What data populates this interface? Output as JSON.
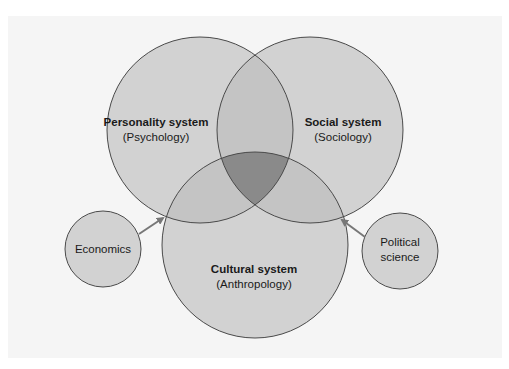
{
  "diagram": {
    "type": "venn",
    "colors": {
      "background": "#f5f5f5",
      "circle_fill": "#d2d2d2",
      "pair_overlap_fill": "#c4c4c4",
      "triple_overlap_fill": "#8a8a8a",
      "outline": "#4a4a4a",
      "arrow": "#777777"
    },
    "main_sets": [
      {
        "id": "personality",
        "title": "Personality system",
        "subtitle": "(Psychology)"
      },
      {
        "id": "social",
        "title": "Social system",
        "subtitle": "(Sociology)"
      },
      {
        "id": "cultural",
        "title": "Cultural system",
        "subtitle": "(Anthropology)"
      }
    ],
    "outer_nodes": [
      {
        "id": "economics",
        "lines": [
          "Economics"
        ],
        "points_to": "center"
      },
      {
        "id": "political-science",
        "lines": [
          "Political",
          "science"
        ],
        "points_to": "center"
      }
    ]
  }
}
